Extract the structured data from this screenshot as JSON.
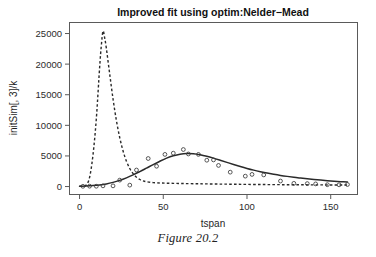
{
  "figure": {
    "caption": "Figure 20.2"
  },
  "chart_data": {
    "type": "line",
    "title": "Improved fit using optim:Nelder−Mead",
    "xlabel": "tspan",
    "ylabel": "initSim[, 3]/k",
    "xlim": [
      -6,
      166
    ],
    "ylim": [
      -1300,
      26800
    ],
    "xticks": [
      0,
      50,
      100,
      150
    ],
    "xtick_labels": [
      "0",
      "50",
      "100",
      "150"
    ],
    "yticks": [
      0,
      5000,
      10000,
      15000,
      20000,
      25000
    ],
    "ytick_labels": [
      "0",
      "5000",
      "10000",
      "15000",
      "20000",
      "25000"
    ],
    "grid": false,
    "legend": "none",
    "series": [
      {
        "name": "fitted-model-solid",
        "style": "solid",
        "x": [
          0,
          4,
          8,
          12,
          16,
          20,
          24,
          28,
          32,
          36,
          40,
          44,
          48,
          52,
          56,
          60,
          64,
          68,
          72,
          76,
          80,
          84,
          88,
          92,
          96,
          100,
          104,
          108,
          112,
          116,
          120,
          124,
          128,
          132,
          136,
          140,
          144,
          148,
          152,
          156,
          160
        ],
        "values": [
          60,
          90,
          150,
          260,
          430,
          680,
          1010,
          1420,
          1900,
          2440,
          3010,
          3590,
          4140,
          4640,
          5030,
          5290,
          5400,
          5360,
          5200,
          4950,
          4640,
          4300,
          3950,
          3600,
          3270,
          2960,
          2680,
          2430,
          2200,
          2000,
          1820,
          1660,
          1510,
          1380,
          1260,
          1150,
          1050,
          960,
          880,
          800,
          730
        ]
      },
      {
        "name": "initial-model-dashed",
        "style": "dashed",
        "x": [
          0,
          2,
          4,
          6,
          8,
          10,
          12,
          13,
          14,
          15,
          16,
          18,
          20,
          22,
          24,
          26,
          28,
          30,
          32,
          34,
          36,
          38,
          40,
          44,
          48,
          52,
          56,
          60,
          64,
          70,
          76,
          84,
          92,
          100,
          110,
          120,
          130,
          140,
          150,
          160
        ],
        "values": [
          40,
          80,
          260,
          1500,
          5100,
          11000,
          19500,
          23000,
          25400,
          24300,
          22600,
          18400,
          14300,
          10800,
          8000,
          5800,
          4150,
          2950,
          2100,
          1520,
          1150,
          920,
          780,
          640,
          580,
          545,
          520,
          500,
          480,
          455,
          430,
          400,
          375,
          350,
          325,
          305,
          290,
          275,
          262,
          250
        ]
      }
    ],
    "observations": {
      "name": "observed-data-points",
      "marker": "open-circle",
      "x": [
        2,
        6,
        10,
        14,
        20,
        24,
        30,
        34,
        41,
        46,
        51,
        56,
        62,
        65,
        71,
        76,
        80,
        83,
        90,
        99,
        103,
        110,
        120,
        128,
        136,
        141,
        148,
        155,
        160
      ],
      "values": [
        40,
        60,
        50,
        110,
        110,
        1050,
        230,
        2700,
        4580,
        3320,
        5250,
        5450,
        6050,
        5320,
        5250,
        4300,
        4350,
        3450,
        2350,
        1700,
        1980,
        1900,
        900,
        520,
        480,
        430,
        300,
        280,
        330
      ]
    }
  }
}
